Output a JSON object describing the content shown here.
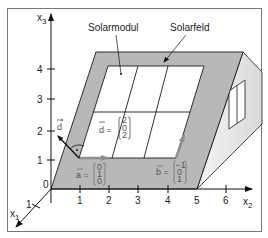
{
  "labels": {
    "module": "Solarmodul",
    "field": "Solarfeld"
  },
  "axes": {
    "x1": {
      "name": "x",
      "sub": "1",
      "ticks": [
        "1"
      ]
    },
    "x2": {
      "name": "x",
      "sub": "2",
      "ticks": [
        "1",
        "2",
        "3",
        "4",
        "5",
        "6"
      ]
    },
    "x3": {
      "name": "x",
      "sub": "3",
      "ticks": [
        "1",
        "2",
        "3",
        "4"
      ]
    },
    "origin": "0"
  },
  "vectors": {
    "d_label": "d",
    "d_eq": "d =",
    "d_components": [
      "2",
      "0",
      "2"
    ],
    "a_eq": "a =",
    "a_components": [
      "0",
      "1",
      "0"
    ],
    "b_eq": "b =",
    "b_components": [
      "−1",
      "0",
      "1"
    ]
  },
  "colors": {
    "field_gray": "#b8b8b8",
    "side_face": "#e4e4e4",
    "stroke": "#1a1a1a",
    "vector_arrow": "#9a9a9a"
  }
}
